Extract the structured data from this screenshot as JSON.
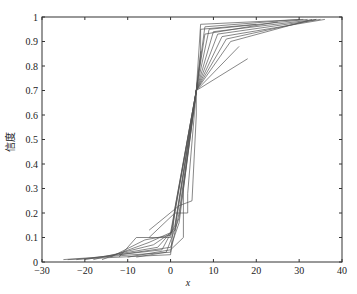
{
  "chart_data": {
    "type": "line",
    "title": "",
    "xlabel": "x",
    "ylabel": "信度",
    "xlim": [
      -30,
      40
    ],
    "ylim": [
      0,
      1
    ],
    "grid": false,
    "legend": null,
    "xticks": [
      -30,
      -20,
      -10,
      0,
      10,
      20,
      30,
      40
    ],
    "xtick_labels": [
      "-30",
      "-20",
      "-10",
      "0",
      "10",
      "20",
      "30",
      "40"
    ],
    "yticks": [
      0,
      0.1,
      0.2,
      0.3,
      0.4,
      0.5,
      0.6,
      0.7,
      0.8,
      0.9,
      1
    ],
    "ytick_labels": [
      "0",
      "0.1",
      "0.2",
      "0.3",
      "0.4",
      "0.5",
      "0.6",
      "0.7",
      "0.8",
      "0.9",
      "1"
    ],
    "line_color": "#555555",
    "series": [
      {
        "name": "curve-1",
        "x": [
          -25,
          0,
          2,
          6,
          8,
          30
        ],
        "y": [
          0.01,
          0.04,
          0.2,
          0.7,
          0.96,
          0.99
        ]
      },
      {
        "name": "curve-2",
        "x": [
          -22,
          -2,
          1,
          6,
          9,
          32
        ],
        "y": [
          0.01,
          0.05,
          0.15,
          0.7,
          0.95,
          0.99
        ]
      },
      {
        "name": "curve-3",
        "x": [
          -20,
          -3,
          1,
          6,
          10,
          34
        ],
        "y": [
          0.01,
          0.06,
          0.14,
          0.7,
          0.94,
          0.99
        ]
      },
      {
        "name": "curve-4",
        "x": [
          -18,
          -4,
          1,
          6,
          11,
          35
        ],
        "y": [
          0.01,
          0.07,
          0.13,
          0.7,
          0.93,
          0.99
        ]
      },
      {
        "name": "curve-5",
        "x": [
          -16,
          -5,
          0,
          6,
          12,
          36
        ],
        "y": [
          0.01,
          0.08,
          0.12,
          0.7,
          0.92,
          0.99
        ]
      },
      {
        "name": "curve-6",
        "x": [
          -14,
          -6,
          0,
          6,
          13,
          34
        ],
        "y": [
          0.02,
          0.09,
          0.11,
          0.7,
          0.91,
          0.99
        ]
      },
      {
        "name": "curve-7",
        "x": [
          -12,
          -8,
          0,
          6,
          14,
          33
        ],
        "y": [
          0.02,
          0.1,
          0.1,
          0.7,
          0.9,
          0.99
        ]
      },
      {
        "name": "curve-8",
        "x": [
          -24,
          0,
          1,
          6,
          7,
          31
        ],
        "y": [
          0.01,
          0.03,
          0.22,
          0.7,
          0.97,
          0.99
        ]
      },
      {
        "name": "curve-9",
        "x": [
          -10,
          0,
          3,
          3,
          6,
          16
        ],
        "y": [
          0.02,
          0.05,
          0.1,
          0.3,
          0.7,
          0.88
        ]
      },
      {
        "name": "curve-10",
        "x": [
          -5,
          1,
          4,
          4,
          6,
          18
        ],
        "y": [
          0.1,
          0.2,
          0.2,
          0.28,
          0.7,
          0.83
        ]
      },
      {
        "name": "curve-11",
        "x": [
          -5,
          2,
          5,
          6,
          6,
          7
        ],
        "y": [
          0.13,
          0.23,
          0.25,
          0.6,
          0.7,
          0.86
        ]
      },
      {
        "name": "curve-12",
        "x": [
          -8,
          -1,
          2,
          6,
          7,
          7,
          20
        ],
        "y": [
          0.02,
          0.04,
          0.18,
          0.7,
          0.84,
          0.95,
          0.97
        ]
      },
      {
        "name": "curve-13",
        "x": [
          -12,
          0,
          2,
          6,
          8,
          25
        ],
        "y": [
          0.03,
          0.06,
          0.16,
          0.7,
          0.93,
          0.98
        ]
      }
    ]
  }
}
